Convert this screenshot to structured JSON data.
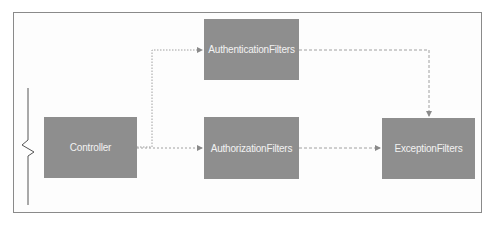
{
  "diagram": {
    "nodes": [
      {
        "id": "controller",
        "label": "Controller"
      },
      {
        "id": "authentication",
        "label": "AuthenticationFilters"
      },
      {
        "id": "authorization",
        "label": "AuthorizationFilters"
      },
      {
        "id": "exception",
        "label": "ExceptionFilters"
      }
    ],
    "edges": [
      {
        "from": "controller",
        "to": "authentication",
        "style": "dotted"
      },
      {
        "from": "controller",
        "to": "authorization",
        "style": "dotted"
      },
      {
        "from": "authentication",
        "to": "exception",
        "style": "dashed"
      },
      {
        "from": "authorization",
        "to": "exception",
        "style": "dashed"
      }
    ],
    "colors": {
      "node_fill": "#8e8e8e",
      "node_text": "#f2f2f2",
      "edge": "#9a9a9a",
      "frame": "#8a8a8a"
    }
  }
}
